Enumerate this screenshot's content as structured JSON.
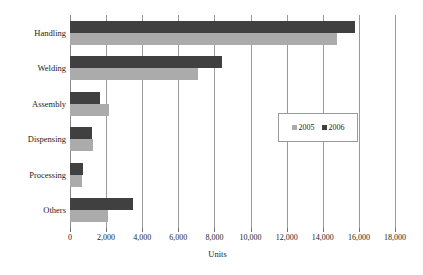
{
  "chart_data": {
    "type": "bar",
    "orientation": "horizontal",
    "title": "",
    "xlabel": "Units",
    "ylabel": "",
    "xlim": [
      0,
      18000
    ],
    "xticks": [
      0,
      2000,
      4000,
      6000,
      8000,
      10000,
      12000,
      14000,
      16000,
      18000
    ],
    "xtick_labels": [
      "0",
      "2,000",
      "4,000",
      "6,000",
      "8,000",
      "10,000",
      "12,000",
      "14,000",
      "16,000",
      "18,000"
    ],
    "grid": true,
    "grid_axis": "x",
    "legend_position": "center-right",
    "categories": [
      "Handling",
      "Welding",
      "Assembly",
      "Dispensing",
      "Processing",
      "Others"
    ],
    "series": [
      {
        "name": "2005",
        "color": "#ababab",
        "values": [
          14800,
          7100,
          2150,
          1300,
          650,
          2100
        ]
      },
      {
        "name": "2006",
        "color": "#404040",
        "values": [
          15800,
          8400,
          1650,
          1200,
          720,
          3500
        ]
      }
    ]
  },
  "legend": {
    "entries": [
      {
        "label": "2005",
        "color": "#ababab"
      },
      {
        "label": "2006",
        "color": "#404040"
      }
    ]
  },
  "axis": {
    "x_title": "Units"
  },
  "colors": {
    "series_2005": "#ababab",
    "series_2006": "#404040",
    "gridline": "#9a9a9a",
    "text": "#1c1c1c",
    "background": "#ffffff"
  }
}
